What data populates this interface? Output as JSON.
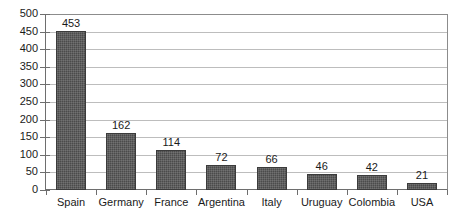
{
  "chart_data": {
    "type": "bar",
    "title": "",
    "subtitle": "",
    "xlabel": "",
    "ylabel": "",
    "categories": [
      "Spain",
      "Germany",
      "France",
      "Argentina",
      "Italy",
      "Uruguay",
      "Colombia",
      "USA"
    ],
    "values": [
      453,
      162,
      114,
      72,
      66,
      46,
      42,
      21
    ],
    "data_labels": [
      "453",
      "162",
      "114",
      "72",
      "66",
      "46",
      "42",
      "21"
    ],
    "ylim": [
      0,
      500
    ],
    "ytick_step": 50,
    "ytick_labels": [
      "500",
      "450",
      "400",
      "350",
      "300",
      "250",
      "200",
      "150",
      "100",
      "50",
      "0"
    ],
    "ytick_values": [
      500,
      450,
      400,
      350,
      300,
      250,
      200,
      150,
      100,
      50,
      0
    ],
    "grid": "horizontal",
    "legend": "none",
    "bar_color": "#4b4b4b",
    "bar_edge_color": "#3b3b3b",
    "gridline_color": "#bdbdbd",
    "axis_color": "#6e6e6e",
    "background_color": "#ffffff",
    "text_color": "#1a1a1a"
  }
}
